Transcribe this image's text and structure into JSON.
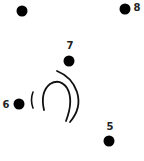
{
  "puzzle": {
    "type": "connect-the-dots",
    "dots": [
      {
        "number": "10",
        "x": 22,
        "y": 11,
        "label_x": 22,
        "label_y": -3
      },
      {
        "number": "8",
        "x": 125,
        "y": 9,
        "label_x": 137,
        "label_y": 8
      },
      {
        "number": "7",
        "x": 69,
        "y": 61,
        "label_x": 70,
        "label_y": 46
      },
      {
        "number": "6",
        "x": 19,
        "y": 104,
        "label_x": 6,
        "label_y": 105
      },
      {
        "number": "5",
        "x": 109,
        "y": 141,
        "label_x": 110,
        "label_y": 127
      }
    ],
    "colors": {
      "dot": "#000000",
      "line": "#111111",
      "label": "#222222",
      "background": "#ffffff"
    }
  }
}
